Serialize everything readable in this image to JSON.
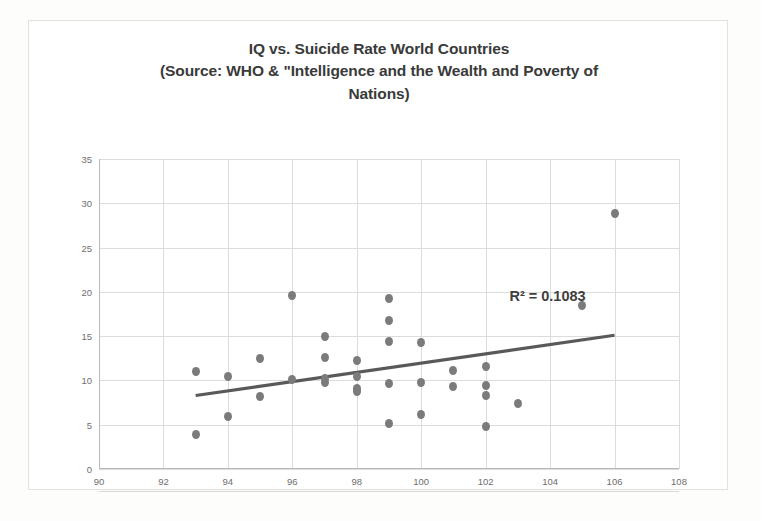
{
  "chart_data": {
    "type": "scatter",
    "title": "IQ vs. Suicide Rate World Countries (Source: WHO & \"Intelligence and the Wealth and Poverty of Nations)",
    "title_lines": [
      "IQ vs. Suicide Rate World Countries",
      "(Source: WHO & \"Intelligence and the Wealth and Poverty of",
      "Nations)"
    ],
    "xlabel": "",
    "ylabel": "",
    "xlim": [
      90,
      108
    ],
    "ylim": [
      0,
      35
    ],
    "xticks": [
      90,
      92,
      94,
      96,
      98,
      100,
      102,
      104,
      106,
      108
    ],
    "yticks": [
      0,
      5,
      10,
      15,
      20,
      25,
      30,
      35
    ],
    "grid": true,
    "legend": false,
    "marker_color": "#7b7b7b",
    "trendline_color": "#595959",
    "gridline_color": "#dcdcdc",
    "annotations": [
      {
        "text": "R² = 0.1083",
        "x": 104.6,
        "y": 19.3
      }
    ],
    "trendline": {
      "type": "linear",
      "x_start": 93.0,
      "y_start": 8.3,
      "x_end": 106.0,
      "y_end": 15.1
    },
    "points": [
      {
        "x": 93.0,
        "y": 11.0
      },
      {
        "x": 93.0,
        "y": 3.9
      },
      {
        "x": 94.0,
        "y": 10.4
      },
      {
        "x": 94.0,
        "y": 5.9
      },
      {
        "x": 95.0,
        "y": 12.5
      },
      {
        "x": 95.0,
        "y": 8.2
      },
      {
        "x": 96.0,
        "y": 19.6
      },
      {
        "x": 96.0,
        "y": 10.1
      },
      {
        "x": 97.0,
        "y": 15.0
      },
      {
        "x": 97.0,
        "y": 12.6
      },
      {
        "x": 97.0,
        "y": 10.2
      },
      {
        "x": 97.0,
        "y": 9.8
      },
      {
        "x": 98.0,
        "y": 12.3
      },
      {
        "x": 98.0,
        "y": 10.5
      },
      {
        "x": 98.0,
        "y": 9.1
      },
      {
        "x": 98.0,
        "y": 8.8
      },
      {
        "x": 99.0,
        "y": 19.2
      },
      {
        "x": 99.0,
        "y": 16.8
      },
      {
        "x": 99.0,
        "y": 14.4
      },
      {
        "x": 99.0,
        "y": 9.7
      },
      {
        "x": 99.0,
        "y": 5.1
      },
      {
        "x": 100.0,
        "y": 14.3
      },
      {
        "x": 100.0,
        "y": 9.8
      },
      {
        "x": 100.0,
        "y": 6.2
      },
      {
        "x": 101.0,
        "y": 11.1
      },
      {
        "x": 101.0,
        "y": 9.3
      },
      {
        "x": 102.0,
        "y": 11.6
      },
      {
        "x": 102.0,
        "y": 9.4
      },
      {
        "x": 102.0,
        "y": 8.3
      },
      {
        "x": 102.0,
        "y": 4.8
      },
      {
        "x": 103.0,
        "y": 7.4
      },
      {
        "x": 105.0,
        "y": 18.5
      },
      {
        "x": 106.0,
        "y": 28.9
      }
    ]
  }
}
